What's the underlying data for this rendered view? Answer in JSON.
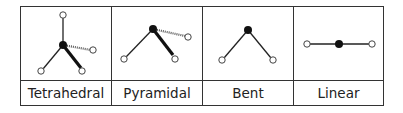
{
  "diagram": {
    "columns": [
      {
        "label": "Tetrahedral",
        "icon": "tetrahedral-molecule-icon"
      },
      {
        "label": "Pyramidal",
        "icon": "pyramidal-molecule-icon"
      },
      {
        "label": "Bent",
        "icon": "bent-molecule-icon"
      },
      {
        "label": "Linear",
        "icon": "linear-molecule-icon"
      }
    ],
    "colors": {
      "border": "#333333",
      "atom_central": "#111111",
      "atom_outer_stroke": "#444444",
      "bond": "#222222"
    }
  }
}
